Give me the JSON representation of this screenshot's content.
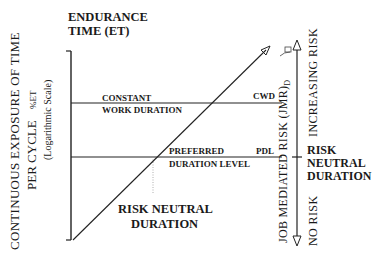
{
  "title": {
    "line1": "ENDURANCE",
    "line2": "TIME (ET)"
  },
  "y_axis": {
    "line1": "CONTINUOUS  EXPOSURE  OF  TIME",
    "line2": "PER  CYCLE",
    "unit": "%ET",
    "scale_note": "(Logarithmic Scale)"
  },
  "right_axis": {
    "label": "JOB  MEDIATED  RISK  (JMR)",
    "subscript": "D",
    "top_label": "INCREASING  RISK",
    "bottom_label": "NO  RISK",
    "mid_label": [
      "RISK",
      "NEUTRAL",
      "DURATION"
    ]
  },
  "lines": {
    "cwd": {
      "label_line1": "CONSTANT",
      "label_line2": "WORK DURATION",
      "tag": "CWD"
    },
    "pdl": {
      "label_line1": "PREFERRED",
      "label_line2": "DURATION LEVEL",
      "tag": "PDL"
    }
  },
  "bottom_label": {
    "line1": "RISK NEUTRAL",
    "line2": "DURATION"
  }
}
